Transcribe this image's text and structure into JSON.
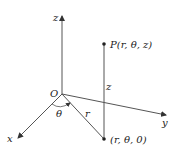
{
  "diagram": {
    "axes": {
      "z_label": "z",
      "y_label": "y",
      "x_label": "x",
      "origin_label": "O"
    },
    "point_P": {
      "label": "P(r, θ, z)"
    },
    "point_proj": {
      "label": "(r, θ, 0)"
    },
    "segment_labels": {
      "height": "z",
      "radius": "r",
      "angle": "θ"
    },
    "colors": {
      "line": "#444444",
      "point": "#222222"
    }
  }
}
